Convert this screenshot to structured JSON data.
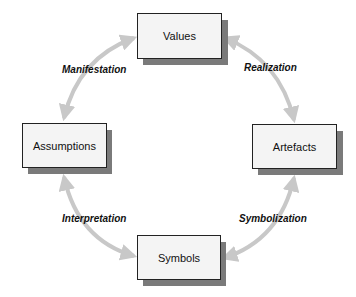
{
  "diagram": {
    "type": "cycle",
    "colors": {
      "box_fill": "#f4f4f4",
      "box_border": "#222222",
      "box_shadow": "#7a7a7a",
      "arrow": "#c8c8c8",
      "text": "#111111"
    },
    "nodes": [
      {
        "id": "values",
        "label": "Values"
      },
      {
        "id": "artefacts",
        "label": "Artefacts"
      },
      {
        "id": "symbols",
        "label": "Symbols"
      },
      {
        "id": "assumptions",
        "label": "Assumptions"
      }
    ],
    "edges": [
      {
        "from": "values",
        "to": "artefacts",
        "label": "Realization",
        "bidirectional": true
      },
      {
        "from": "artefacts",
        "to": "symbols",
        "label": "Symbolization",
        "bidirectional": true
      },
      {
        "from": "symbols",
        "to": "assumptions",
        "label": "Interpretation",
        "bidirectional": true
      },
      {
        "from": "assumptions",
        "to": "values",
        "label": "Manifestation",
        "bidirectional": true
      }
    ]
  }
}
